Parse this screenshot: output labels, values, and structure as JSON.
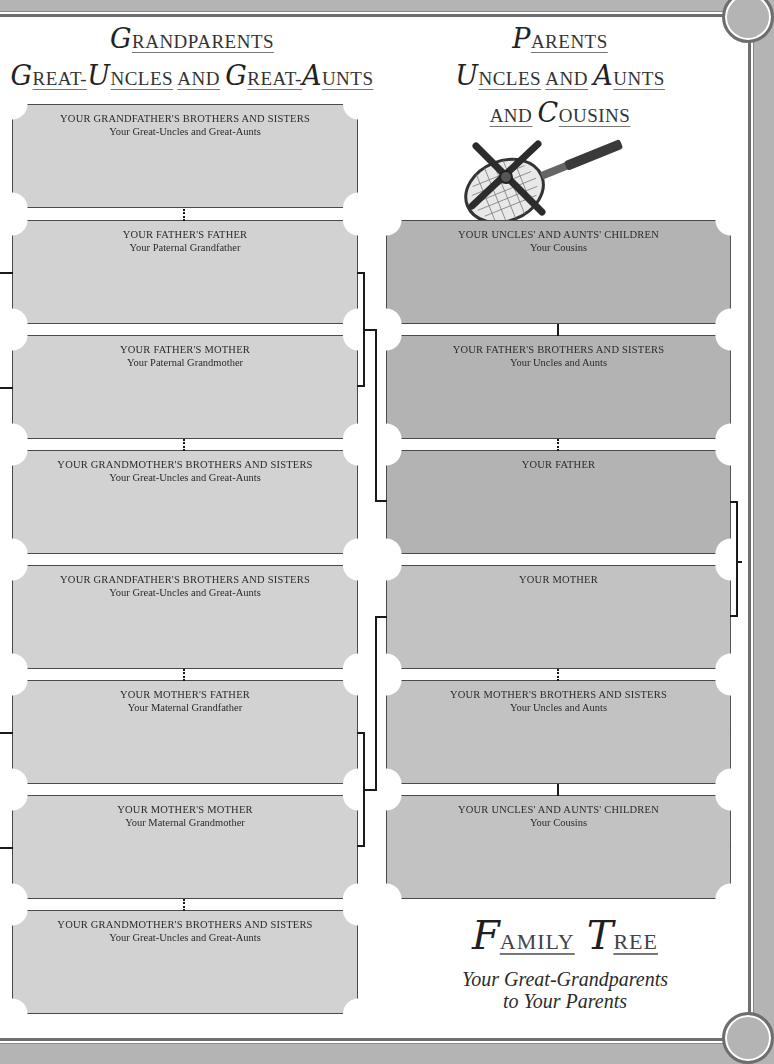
{
  "left_heading": {
    "line1": {
      "cap": "G",
      "rest": "RANDPARENTS"
    },
    "line2": [
      {
        "cap": "G",
        "rest": "REAT-"
      },
      {
        "cap": "U",
        "rest": "NCLES"
      },
      {
        "cap": "",
        "rest": "AND"
      },
      {
        "cap": "G",
        "rest": "REAT-"
      },
      {
        "cap": "A",
        "rest": "UNTS"
      }
    ]
  },
  "right_heading": {
    "line1": {
      "cap": "P",
      "rest": "ARENTS"
    },
    "line2": [
      {
        "cap": "U",
        "rest": "NCLES"
      },
      {
        "cap": "",
        "rest": "AND"
      },
      {
        "cap": "A",
        "rest": "UNTS"
      }
    ],
    "line3": [
      {
        "cap": "",
        "rest": "AND"
      },
      {
        "cap": "C",
        "rest": "OUSINS"
      }
    ]
  },
  "illustration": "tennis-racket-in-press",
  "left_boxes": [
    {
      "title": "YOUR GRANDFATHER'S BROTHERS AND SISTERS",
      "sub": "Your Great-Uncles and Great-Aunts"
    },
    {
      "title": "YOUR FATHER'S FATHER",
      "sub": "Your Paternal Grandfather"
    },
    {
      "title": "YOUR FATHER'S MOTHER",
      "sub": "Your Paternal Grandmother"
    },
    {
      "title": "YOUR GRANDMOTHER'S BROTHERS AND SISTERS",
      "sub": "Your Great-Uncles and Great-Aunts"
    },
    {
      "title": "YOUR GRANDFATHER'S BROTHERS AND SISTERS",
      "sub": "Your Great-Uncles and Great-Aunts"
    },
    {
      "title": "YOUR MOTHER'S FATHER",
      "sub": "Your Maternal Grandfather"
    },
    {
      "title": "YOUR MOTHER'S MOTHER",
      "sub": "Your Maternal Grandmother"
    },
    {
      "title": "YOUR GRANDMOTHER'S BROTHERS AND SISTERS",
      "sub": "Your Great-Uncles and Great-Aunts"
    }
  ],
  "right_boxes": [
    {
      "title": "YOUR UNCLES' AND AUNTS' CHILDREN",
      "sub": "Your Cousins"
    },
    {
      "title": "YOUR FATHER'S BROTHERS AND SISTERS",
      "sub": "Your Uncles and Aunts"
    },
    {
      "title": "YOUR FATHER",
      "sub": ""
    },
    {
      "title": "YOUR MOTHER",
      "sub": ""
    },
    {
      "title": "YOUR MOTHER'S BROTHERS AND SISTERS",
      "sub": "Your Uncles and Aunts"
    },
    {
      "title": "YOUR UNCLES' AND AUNTS' CHILDREN",
      "sub": "Your Cousins"
    }
  ],
  "footer": {
    "title": [
      {
        "cap": "F",
        "rest": "AMILY"
      },
      {
        "cap": "T",
        "rest": "REE"
      }
    ],
    "subtitle_line1": "Your Great-Grandparents",
    "subtitle_line2": "to Your Parents"
  },
  "colors": {
    "background": "#b4b4b4",
    "page": "#ffffff",
    "left_box_fill": "#d2d2d2",
    "right_box_fill": "#b3b3b3",
    "border": "#4a4a4a",
    "connector": "#1a1a1a"
  }
}
